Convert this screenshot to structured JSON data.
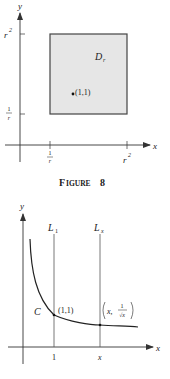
{
  "figure8": {
    "caption_prefix": "F",
    "caption_word": "IGURE",
    "caption_number": "8",
    "caption": "FIGURE 8",
    "x_axis_label": "x",
    "y_axis_label": "y",
    "region_label_main": "D",
    "region_label_sub": "r",
    "point_label": "(1,1)",
    "x_ticks": [
      {
        "num": "1",
        "den": "r",
        "label": "1/r"
      },
      {
        "base": "r",
        "exp": "2",
        "label": "r²"
      }
    ],
    "y_ticks": [
      {
        "base": "r",
        "exp": "2",
        "label": "r²"
      },
      {
        "num": "1",
        "den": "r",
        "label": "1/r"
      }
    ],
    "colors": {
      "region_fill": "#e6e6e6",
      "region_stroke": "#444444",
      "axis": "#333333"
    }
  },
  "figure_curve": {
    "x_axis_label": "x",
    "y_axis_label": "y",
    "line1_main": "L",
    "line1_sub": "1",
    "line2_main": "L",
    "line2_sub": "x",
    "curve_label": "C",
    "point1_label": "(1,1)",
    "point2_x": "x,",
    "point2_num": "1",
    "point2_den": "√x",
    "point2_label": "(x, 1/√x)",
    "x_ticks": [
      "1",
      "x"
    ],
    "colors": {
      "curve": "#222222",
      "axis": "#333333",
      "lines": "#555555"
    }
  }
}
